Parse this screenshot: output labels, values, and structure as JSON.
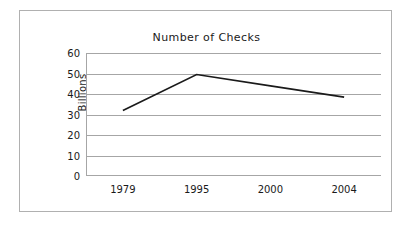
{
  "chart_data": {
    "type": "line",
    "title": "Number of Checks",
    "xlabel": "",
    "ylabel": "Billions",
    "categories": [
      "1979",
      "1995",
      "2000",
      "2004"
    ],
    "x": [
      "1979",
      "1995",
      "2000",
      "2004"
    ],
    "values": [
      32,
      49.5,
      44,
      38.5
    ],
    "series": [
      {
        "name": "Number of Checks",
        "values": [
          32,
          49.5,
          44,
          38.5
        ]
      }
    ],
    "ylim": [
      0,
      60
    ],
    "y_ticks": [
      "0",
      "10",
      "20",
      "30",
      "40",
      "50",
      "60"
    ],
    "y_tick_values": [
      0,
      10,
      20,
      30,
      40,
      50,
      60
    ],
    "grid": true,
    "grid_axis": "y",
    "legend": false,
    "legend_position": "none",
    "markers": false,
    "line_color": "#1a1a1a",
    "grid_color": "#a6a6a6",
    "axis_color": "#a6a6a6",
    "border_color": "#b0b0b0",
    "background_color": "#ffffff",
    "text_color": "#1a1a1a"
  }
}
